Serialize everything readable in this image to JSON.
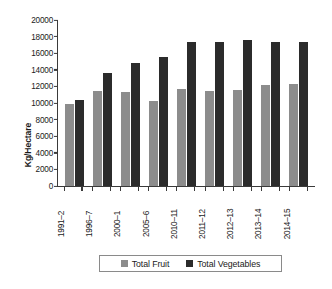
{
  "chart_data": {
    "type": "bar",
    "title": "",
    "xlabel": "",
    "ylabel": "Kg/Hectare",
    "ylim": [
      0,
      20000
    ],
    "ytick_step": 2000,
    "yticks": [
      20000,
      18000,
      16000,
      14000,
      12000,
      10000,
      8000,
      6000,
      4000,
      2000,
      0
    ],
    "ytick_labels": [
      "20000",
      "18000",
      "16000",
      "14000",
      "12000",
      "10000",
      "8000",
      "6000",
      "4000",
      "2000",
      "0"
    ],
    "grid": false,
    "legend_position": "bottom",
    "categories": [
      "1991–2",
      "1996–7",
      "2000–1",
      "2005–6",
      "2010–11",
      "2011–12",
      "2012–13",
      "2013–14",
      "2014–15"
    ],
    "series": [
      {
        "name": "Total Fruit",
        "color": "#8c8c8c",
        "values": [
          9900,
          11400,
          11300,
          10300,
          11700,
          11450,
          11550,
          12150,
          12250
        ]
      },
      {
        "name": "Total Vegetables",
        "color": "#2b2b2b",
        "values": [
          10400,
          13600,
          14850,
          15500,
          17300,
          17400,
          17550,
          17300,
          17400
        ]
      }
    ]
  },
  "legend": {
    "items": [
      {
        "label": "Total Fruit",
        "swatch": "fruit-swatch"
      },
      {
        "label": "Total Vegetables",
        "swatch": "vegetables-swatch"
      }
    ]
  }
}
